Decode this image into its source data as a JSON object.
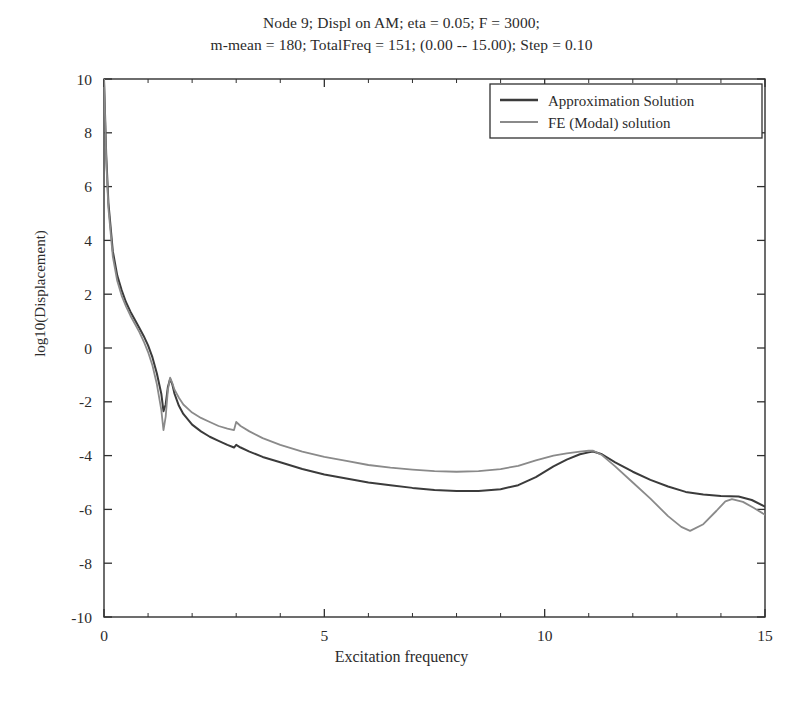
{
  "chart_data": {
    "type": "line",
    "title": "Node 9; Displ on AM; eta = 0.05; F = 3000;\nm-mean = 180; TotalFreq = 151; (0.00 -- 15.00); Step = 0.10",
    "title_lines": [
      "Node 9; Displ on AM; eta = 0.05; F = 3000;",
      "m-mean = 180; TotalFreq = 151; (0.00 -- 15.00); Step = 0.10"
    ],
    "xlabel": "Excitation frequency",
    "ylabel": "log10(Displacement)",
    "xlim": [
      0,
      15
    ],
    "ylim": [
      -10,
      10
    ],
    "xticks": [
      0,
      5,
      10,
      15
    ],
    "xtick_labels": [
      "0",
      "5",
      "10",
      "15"
    ],
    "x_minor_ticks": [
      1,
      2,
      3,
      4,
      6,
      7,
      8,
      9,
      11,
      12,
      13,
      14
    ],
    "yticks": [
      -10,
      -8,
      -6,
      -4,
      -2,
      0,
      2,
      4,
      6,
      8,
      10
    ],
    "ytick_labels": [
      "-10",
      "-8",
      "-6",
      "-4",
      "-2",
      "0",
      "2",
      "4",
      "6",
      "8",
      "10"
    ],
    "grid": false,
    "legend_position": "upper right",
    "legend": [
      "Approximation Solution",
      "FE (Modal) solution"
    ],
    "colors": {
      "approximation": "#3b3b3b",
      "fe_modal": "#8a8a8a",
      "axis": "#303030",
      "background": "#ffffff"
    },
    "series": [
      {
        "name": "Approximation Solution",
        "color": "#3b3b3b",
        "x": [
          0.0,
          0.05,
          0.1,
          0.2,
          0.3,
          0.4,
          0.5,
          0.6,
          0.7,
          0.8,
          0.9,
          1.0,
          1.1,
          1.2,
          1.3,
          1.35,
          1.4,
          1.45,
          1.5,
          1.55,
          1.6,
          1.7,
          1.8,
          2.0,
          2.2,
          2.4,
          2.6,
          2.8,
          2.95,
          3.0,
          3.1,
          3.3,
          3.6,
          4.0,
          4.5,
          5.0,
          5.5,
          6.0,
          6.5,
          7.0,
          7.5,
          8.0,
          8.5,
          9.0,
          9.4,
          9.8,
          10.2,
          10.5,
          10.8,
          11.0,
          11.1,
          11.3,
          11.6,
          12.0,
          12.4,
          12.8,
          13.2,
          13.6,
          14.0,
          14.4,
          14.7,
          15.0
        ],
        "y": [
          10.0,
          7.2,
          5.4,
          3.6,
          2.7,
          2.15,
          1.7,
          1.35,
          1.05,
          0.75,
          0.45,
          0.1,
          -0.35,
          -0.95,
          -1.7,
          -2.35,
          -2.1,
          -1.45,
          -1.15,
          -1.35,
          -1.7,
          -2.15,
          -2.45,
          -2.85,
          -3.1,
          -3.3,
          -3.45,
          -3.6,
          -3.7,
          -3.6,
          -3.7,
          -3.85,
          -4.05,
          -4.25,
          -4.5,
          -4.7,
          -4.85,
          -5.0,
          -5.1,
          -5.2,
          -5.28,
          -5.32,
          -5.32,
          -5.25,
          -5.1,
          -4.8,
          -4.4,
          -4.15,
          -3.95,
          -3.88,
          -3.85,
          -3.95,
          -4.25,
          -4.6,
          -4.9,
          -5.15,
          -5.35,
          -5.45,
          -5.5,
          -5.52,
          -5.65,
          -5.9
        ]
      },
      {
        "name": "FE (Modal) solution",
        "color": "#8a8a8a",
        "x": [
          0.0,
          0.05,
          0.1,
          0.2,
          0.3,
          0.4,
          0.5,
          0.6,
          0.7,
          0.8,
          0.9,
          1.0,
          1.1,
          1.2,
          1.3,
          1.35,
          1.4,
          1.45,
          1.5,
          1.55,
          1.6,
          1.7,
          1.8,
          2.0,
          2.2,
          2.4,
          2.6,
          2.8,
          2.95,
          3.0,
          3.1,
          3.3,
          3.6,
          4.0,
          4.5,
          5.0,
          5.5,
          6.0,
          6.5,
          7.0,
          7.5,
          8.0,
          8.5,
          9.0,
          9.4,
          9.8,
          10.2,
          10.5,
          10.8,
          11.0,
          11.1,
          11.3,
          11.6,
          12.0,
          12.4,
          12.8,
          13.1,
          13.3,
          13.6,
          13.9,
          14.1,
          14.25,
          14.5,
          14.75,
          15.0
        ],
        "y": [
          10.0,
          7.0,
          5.2,
          3.4,
          2.5,
          1.95,
          1.55,
          1.2,
          0.9,
          0.6,
          0.25,
          -0.15,
          -0.65,
          -1.35,
          -2.3,
          -3.05,
          -2.55,
          -1.55,
          -1.1,
          -1.3,
          -1.55,
          -1.85,
          -2.1,
          -2.4,
          -2.6,
          -2.75,
          -2.9,
          -3.0,
          -3.05,
          -2.75,
          -2.9,
          -3.1,
          -3.35,
          -3.6,
          -3.85,
          -4.05,
          -4.2,
          -4.35,
          -4.45,
          -4.52,
          -4.58,
          -4.6,
          -4.58,
          -4.5,
          -4.38,
          -4.18,
          -4.0,
          -3.92,
          -3.85,
          -3.82,
          -3.82,
          -3.98,
          -4.4,
          -5.0,
          -5.6,
          -6.25,
          -6.65,
          -6.8,
          -6.55,
          -6.05,
          -5.7,
          -5.62,
          -5.72,
          -5.95,
          -6.2
        ]
      }
    ],
    "annotations": [
      "Anti-resonance dip near f = 1.35 followed by resonance peak near f = 1.5",
      "Small kink in both curves near f = 3.0",
      "Broad resonance peak near f = 11.1",
      "FE (Modal) curve dips to a minimum near f = 13.3 then a local bump near f = 14.2"
    ]
  },
  "axes_geometry": {
    "left": 104,
    "right": 765,
    "top": 79,
    "bottom": 617
  },
  "legend_box": {
    "left": 490,
    "top": 84,
    "width": 272,
    "height": 54
  }
}
